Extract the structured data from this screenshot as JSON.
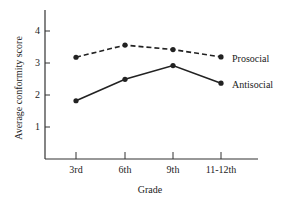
{
  "chart_data": {
    "type": "line",
    "title": "",
    "xlabel": "Grade",
    "ylabel": "Average conformity score",
    "categories": [
      "3rd",
      "6th",
      "9th",
      "11-12th"
    ],
    "yticks": [
      "1",
      "2",
      "3",
      "4"
    ],
    "ylim": [
      0,
      4.5
    ],
    "grid": false,
    "legend_position": "inline-right",
    "series": [
      {
        "name": "Prosocial",
        "style": "dashed",
        "values": [
          3.18,
          3.56,
          3.42,
          3.19
        ]
      },
      {
        "name": "Antisocial",
        "style": "solid",
        "values": [
          1.82,
          2.49,
          2.92,
          2.37
        ]
      }
    ]
  }
}
